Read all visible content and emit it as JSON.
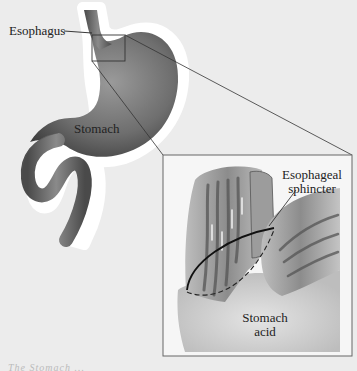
{
  "labels": {
    "esophagus": "Esophagus",
    "stomach": "Stomach",
    "sphincter_line1": "Esophageal",
    "sphincter_line2": "sphincter",
    "acid_line1": "Stomach",
    "acid_line2": "acid"
  },
  "caption": "The Stomach ...",
  "colors": {
    "background": "#ececec",
    "organ_dark": "#4a4a4a",
    "organ_mid": "#7a7a7a",
    "organ_light": "#a8a8a8",
    "halo": "#ffffff",
    "inset_bg": "#f4f4f4",
    "line": "#333333"
  },
  "inset": {
    "x": 163,
    "y": 155,
    "width": 189,
    "height": 201
  },
  "callout_box": {
    "x": 92,
    "y": 35,
    "width": 33,
    "height": 26
  }
}
